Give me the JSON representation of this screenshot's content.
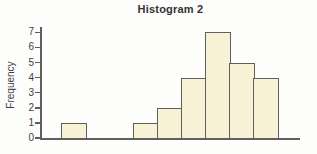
{
  "chart_data": {
    "type": "bar",
    "subtype": "histogram",
    "title": "Histogram 2",
    "ylabel": "Frequency",
    "xlabel": "",
    "values": [
      1,
      0,
      0,
      1,
      2,
      4,
      7,
      5,
      4
    ],
    "num_bins": 9,
    "x_tick_labels": [],
    "yticks": [
      0,
      1,
      2,
      3,
      4,
      5,
      6,
      7
    ],
    "ylim": [
      0,
      7.5
    ],
    "grid": false,
    "legend": false,
    "colors": {
      "bar_fill": "#f7f2d6",
      "bar_border": "#5f5f5f",
      "axis": "#5f5f5f",
      "title_text": "#333333",
      "tick_text": "#3f3f3f",
      "background": "#fdfdfc"
    }
  }
}
